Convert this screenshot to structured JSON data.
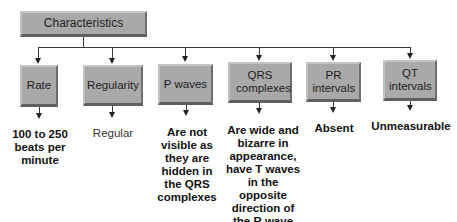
{
  "diagram": {
    "root": {
      "label": "Characteristics"
    },
    "branches": [
      {
        "label": "Rate",
        "description": "100 to 250 beats per minute"
      },
      {
        "label": "Regularity",
        "description": "Regular"
      },
      {
        "label": "P waves",
        "description": "Are not visible as they are hidden in the QRS complexes"
      },
      {
        "label": "QRS complexes",
        "description": "Are wide and bizarre in appearance, have T waves in the opposite direction of the R wave"
      },
      {
        "label": "PR intervals",
        "description": "Absent"
      },
      {
        "label": "QT intervals",
        "description": "Unmeasurable"
      }
    ],
    "colors": {
      "box_fill": "#a9a9a9",
      "line": "#3a3a3a",
      "text": "#111111"
    }
  }
}
